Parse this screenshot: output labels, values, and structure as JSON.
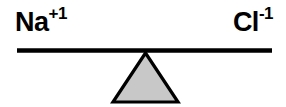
{
  "diagram": {
    "type": "balance-scale",
    "background_color": "#ffffff",
    "stroke_color": "#000000",
    "fulcrum_fill_color": "#c8c8c8",
    "left_label": {
      "symbol": "Na",
      "charge": "+1",
      "full_text": "Na+1"
    },
    "right_label": {
      "symbol": "Cl",
      "charge": "-1",
      "full_text": "Cl-1"
    },
    "beam": {
      "x_start": 17,
      "x_end": 272,
      "y": 50,
      "thickness": 4,
      "tilt": "level"
    },
    "fulcrum": {
      "apex_x": 145,
      "apex_y": 52,
      "base_left_x": 112,
      "base_right_x": 178,
      "base_y": 102,
      "stroke_width": 3
    }
  }
}
